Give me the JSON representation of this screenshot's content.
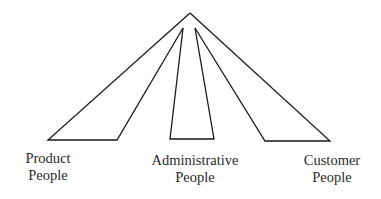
{
  "diagram": {
    "type": "fan-out pyramid",
    "line_color": "#1a1a1a",
    "apex": [
      190,
      13
    ],
    "branches": [
      {
        "id": "product",
        "label_line1": "Product",
        "label_line2": "People",
        "polygon": [
          [
            190,
            13
          ],
          [
            48,
            140
          ],
          [
            117,
            140
          ],
          [
            183,
            28
          ]
        ]
      },
      {
        "id": "administrative",
        "label_line1": "Administrative",
        "label_line2": "People",
        "polygon": [
          [
            183,
            28
          ],
          [
            170,
            139
          ],
          [
            214,
            139
          ],
          [
            195,
            28
          ]
        ]
      },
      {
        "id": "customer",
        "label_line1": "Customer",
        "label_line2": "People",
        "polygon": [
          [
            195,
            28
          ],
          [
            265,
            141
          ],
          [
            330,
            141
          ],
          [
            190,
            13
          ]
        ]
      }
    ]
  }
}
